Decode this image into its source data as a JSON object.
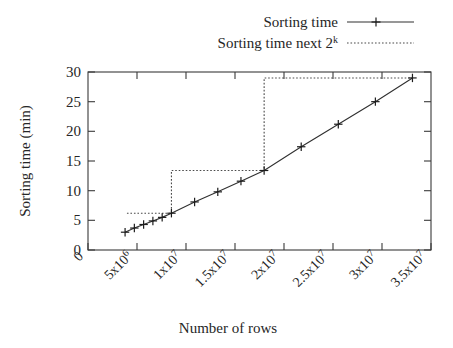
{
  "chart_data": {
    "type": "line",
    "title": "",
    "xlabel": "Number of rows",
    "ylabel": "Sorting time (min)",
    "xlim": [
      0,
      37000000
    ],
    "ylim": [
      0,
      30
    ],
    "grid": false,
    "legend_position": "top-right",
    "x_ticks": [
      {
        "value": 0,
        "label": "0",
        "mantissa": "0",
        "base": "",
        "exponent": ""
      },
      {
        "value": 5000000,
        "label": "5x10^6",
        "mantissa": "5",
        "base": "x10",
        "exponent": "6"
      },
      {
        "value": 10000000,
        "label": "1x10^7",
        "mantissa": "1",
        "base": "x10",
        "exponent": "7"
      },
      {
        "value": 15000000,
        "label": "1.5x10^7",
        "mantissa": "1.5",
        "base": "x10",
        "exponent": "7"
      },
      {
        "value": 20000000,
        "label": "2x10^7",
        "mantissa": "2",
        "base": "x10",
        "exponent": "7"
      },
      {
        "value": 25000000,
        "label": "2.5x10^7",
        "mantissa": "2.5",
        "base": "x10",
        "exponent": "7"
      },
      {
        "value": 30000000,
        "label": "3x10^7",
        "mantissa": "3",
        "base": "x10",
        "exponent": "7"
      },
      {
        "value": 35000000,
        "label": "3.5x10^7",
        "mantissa": "3.5",
        "base": "x10",
        "exponent": "7"
      }
    ],
    "y_ticks": [
      {
        "value": 0,
        "label": "0"
      },
      {
        "value": 5,
        "label": "5"
      },
      {
        "value": 10,
        "label": "10"
      },
      {
        "value": 15,
        "label": "15"
      },
      {
        "value": 20,
        "label": "20"
      },
      {
        "value": 25,
        "label": "25"
      },
      {
        "value": 30,
        "label": "30"
      }
    ],
    "series": [
      {
        "name": "Sorting time",
        "style": "solid-with-cross-markers",
        "color": "#303030",
        "points": [
          {
            "x": 4000000,
            "y": 3.0
          },
          {
            "x": 5000000,
            "y": 3.7
          },
          {
            "x": 6000000,
            "y": 4.3
          },
          {
            "x": 7000000,
            "y": 4.9
          },
          {
            "x": 8000000,
            "y": 5.5
          },
          {
            "x": 9000000,
            "y": 6.2
          },
          {
            "x": 11500000,
            "y": 8.1
          },
          {
            "x": 14000000,
            "y": 9.8
          },
          {
            "x": 16500000,
            "y": 11.6
          },
          {
            "x": 19000000,
            "y": 13.4
          },
          {
            "x": 23000000,
            "y": 17.4
          },
          {
            "x": 27000000,
            "y": 21.2
          },
          {
            "x": 31000000,
            "y": 25.0
          },
          {
            "x": 35000000,
            "y": 29.0
          }
        ]
      },
      {
        "name": "Sorting time next 2^k",
        "style": "dotted-step",
        "color": "#4a4a4a",
        "points": [
          {
            "x": 4200000,
            "y": 6.2
          },
          {
            "x": 9000000,
            "y": 6.2
          },
          {
            "x": 9000000,
            "y": 13.4
          },
          {
            "x": 19000000,
            "y": 13.4
          },
          {
            "x": 19000000,
            "y": 29.0
          },
          {
            "x": 35000000,
            "y": 29.0
          }
        ]
      }
    ],
    "legend": [
      {
        "label_text": "Sorting time",
        "label_main": "Sorting time",
        "label_sup": "",
        "sample": "solid-line-with-cross"
      },
      {
        "label_text": "Sorting time next 2^k",
        "label_main": "Sorting time next 2",
        "label_sup": "k",
        "sample": "dotted-line"
      }
    ]
  }
}
